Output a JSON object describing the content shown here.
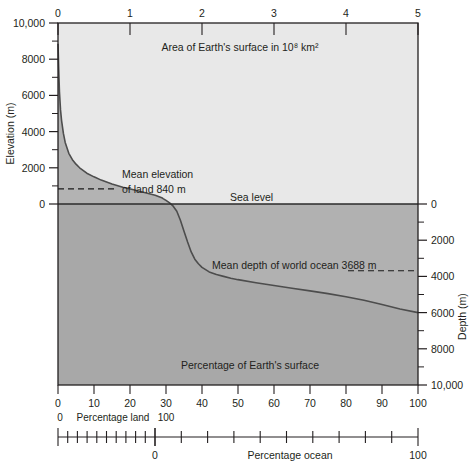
{
  "figure": {
    "kind": "hypsometric-curve",
    "background": "#ffffff",
    "colors": {
      "land_fill": "#b3b3b3",
      "air_fill": "#e8e8e8",
      "ocean_fill": "#a8a8a8",
      "curve": "#4d4d4d",
      "axis": "#231f20",
      "text": "#231f20"
    }
  },
  "axes": {
    "top": {
      "title": "",
      "ticks": [
        "0",
        "1",
        "2",
        "3",
        "4",
        "5"
      ],
      "values": [
        0,
        1,
        2,
        3,
        4,
        5
      ]
    },
    "left": {
      "title": "Elevation (m)",
      "ticks": [
        "10,000",
        "8000",
        "6000",
        "4000",
        "2000",
        "0"
      ],
      "values": [
        10000,
        8000,
        6000,
        4000,
        2000,
        0
      ],
      "minor_step": 1000
    },
    "right": {
      "title": "Depth (m)",
      "ticks": [
        "0",
        "2000",
        "4000",
        "6000",
        "8000",
        "10,000"
      ],
      "values": [
        0,
        2000,
        4000,
        6000,
        8000,
        10000
      ],
      "minor_step": 1000
    },
    "bottom": {
      "title": "Percentage of Earth's surface",
      "ticks": [
        "0",
        "10",
        "20",
        "30",
        "40",
        "50",
        "60",
        "70",
        "80",
        "90",
        "100"
      ],
      "values": [
        0,
        10,
        20,
        30,
        40,
        50,
        60,
        70,
        80,
        90,
        100
      ]
    },
    "land_scale": {
      "title": "Percentage land",
      "start_label": "0",
      "end_label": "100"
    },
    "ocean_scale": {
      "title": "Percentage ocean",
      "start_label": "0",
      "end_label": "100"
    }
  },
  "annotations": {
    "top_note": "Area of Earth's surface in 10⁸ km²",
    "mean_elevation_line1": "Mean elevation",
    "mean_elevation_line2": "of land 840 m",
    "sea_level": "Sea level",
    "mean_depth": "Mean depth of world ocean 3688 m",
    "bottom_note": "Percentage of Earth's surface"
  },
  "chart_data": {
    "type": "area",
    "xlabel": "Percentage of Earth's surface",
    "ylabel": "Elevation (m)",
    "xlim": [
      0,
      100
    ],
    "ylim": [
      -10000,
      10000
    ],
    "x_secondary": {
      "label": "Area of Earth's surface in 10^8 km^2",
      "range": [
        0,
        5
      ]
    },
    "y_secondary": {
      "label": "Depth (m)",
      "range": [
        0,
        10000
      ]
    },
    "grid": false,
    "legend": "none",
    "series": [
      {
        "name": "Cumulative elevation / depth",
        "x": [
          0,
          0.2,
          0.4,
          0.7,
          1.0,
          1.5,
          2,
          3,
          4,
          5,
          6,
          8,
          10,
          12,
          15,
          18,
          21,
          24,
          27,
          29,
          29.2,
          30,
          31,
          32,
          33,
          34,
          35,
          36,
          37,
          38,
          39,
          40,
          42,
          44,
          46,
          48,
          50,
          55,
          60,
          65,
          70,
          75,
          80,
          85,
          90,
          95,
          100
        ],
        "y": [
          8848,
          7400,
          6200,
          5200,
          4600,
          3900,
          3400,
          2800,
          2450,
          2200,
          2000,
          1700,
          1500,
          1320,
          1100,
          930,
          790,
          640,
          480,
          330,
          300,
          200,
          60,
          -120,
          -400,
          -900,
          -1500,
          -2100,
          -2650,
          -3050,
          -3300,
          -3500,
          -3750,
          -3900,
          -4000,
          -4100,
          -4180,
          -4350,
          -4500,
          -4650,
          -4800,
          -4950,
          -5120,
          -5320,
          -5550,
          -5800,
          -6000
        ]
      }
    ],
    "reference_lines": [
      {
        "name": "Mean elevation of land",
        "value": 840,
        "unit": "m",
        "style": "dashed"
      },
      {
        "name": "Sea level",
        "value": 0,
        "unit": "m",
        "style": "solid"
      },
      {
        "name": "Mean depth of world ocean",
        "value": -3688,
        "unit": "m",
        "style": "dashed"
      }
    ],
    "land_fraction_percent": 29,
    "ocean_fraction_percent": 71
  }
}
